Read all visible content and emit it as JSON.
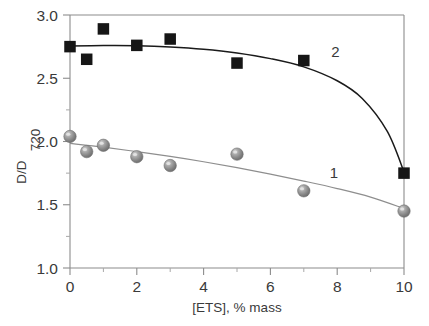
{
  "chart_data": {
    "type": "scatter",
    "title": "",
    "xlabel": "[ETS], % mass",
    "ylabel": "D/D",
    "ylabel_subscript": "720",
    "xlim": [
      0,
      10
    ],
    "ylim": [
      1.0,
      3.0
    ],
    "xticks": [
      0,
      2,
      4,
      6,
      8,
      10
    ],
    "xticklabels": [
      "0",
      "2",
      "4",
      "6",
      "8",
      "10"
    ],
    "xticks_minor": [
      1,
      3,
      5,
      7,
      9
    ],
    "yticks": [
      1.0,
      1.5,
      2.0,
      2.5,
      3.0
    ],
    "yticklabels": [
      "1.0",
      "1.5",
      "2.0",
      "2.5",
      "3.0"
    ],
    "yticks_minor": [
      1.25,
      1.75,
      2.25,
      2.75
    ],
    "grid": false,
    "legend": "inline-curve-labels",
    "series": [
      {
        "name": "1",
        "label": "1",
        "marker": "sphere",
        "color": "#8e8e8e",
        "label_x": 7.9,
        "label_y": 1.71,
        "x": [
          0,
          0.5,
          1,
          2,
          3,
          5,
          7,
          10
        ],
        "values": [
          2.04,
          1.92,
          1.97,
          1.88,
          1.81,
          1.9,
          1.61,
          1.45
        ],
        "fit_curve": [
          [
            0,
            1.985
          ],
          [
            1,
            1.955
          ],
          [
            2,
            1.92
          ],
          [
            3,
            1.882
          ],
          [
            4,
            1.84
          ],
          [
            5,
            1.793
          ],
          [
            6,
            1.742
          ],
          [
            7,
            1.687
          ],
          [
            8,
            1.628
          ],
          [
            9,
            1.56
          ],
          [
            10,
            1.47
          ]
        ]
      },
      {
        "name": "2",
        "label": "2",
        "marker": "square",
        "color": "#161616",
        "label_x": 7.95,
        "label_y": 2.67,
        "x": [
          0,
          0.5,
          1,
          2,
          3,
          5,
          7,
          10
        ],
        "values": [
          2.75,
          2.65,
          2.89,
          2.76,
          2.81,
          2.62,
          2.64,
          1.75
        ],
        "fit_curve": [
          [
            0,
            2.755
          ],
          [
            1,
            2.758
          ],
          [
            2,
            2.757
          ],
          [
            3,
            2.748
          ],
          [
            4,
            2.73
          ],
          [
            5,
            2.7
          ],
          [
            6,
            2.655
          ],
          [
            7,
            2.59
          ],
          [
            8,
            2.48
          ],
          [
            8.75,
            2.34
          ],
          [
            9.5,
            2.08
          ],
          [
            10,
            1.76
          ]
        ]
      }
    ]
  }
}
